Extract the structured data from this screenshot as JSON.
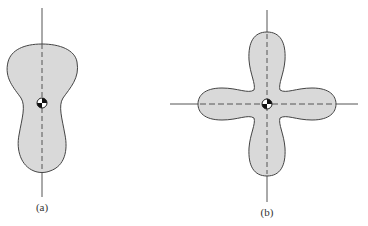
{
  "figures": [
    {
      "id": "a",
      "label": "(a)",
      "shape": "peanut/guitar-shaped lamina with vertical axis through centroid",
      "fill": "#d9d9d9",
      "stroke": "#444444"
    },
    {
      "id": "b",
      "label": "(b)",
      "shape": "four-lobed (cross/clover) lamina with horizontal and vertical axes through centroid",
      "fill": "#d9d9d9",
      "stroke": "#444444"
    }
  ],
  "colors": {
    "fill": "#d9d9d9",
    "outline": "#444444",
    "axis": "#555555",
    "background": "#ffffff"
  },
  "icons": [
    "centroid-symbol"
  ]
}
